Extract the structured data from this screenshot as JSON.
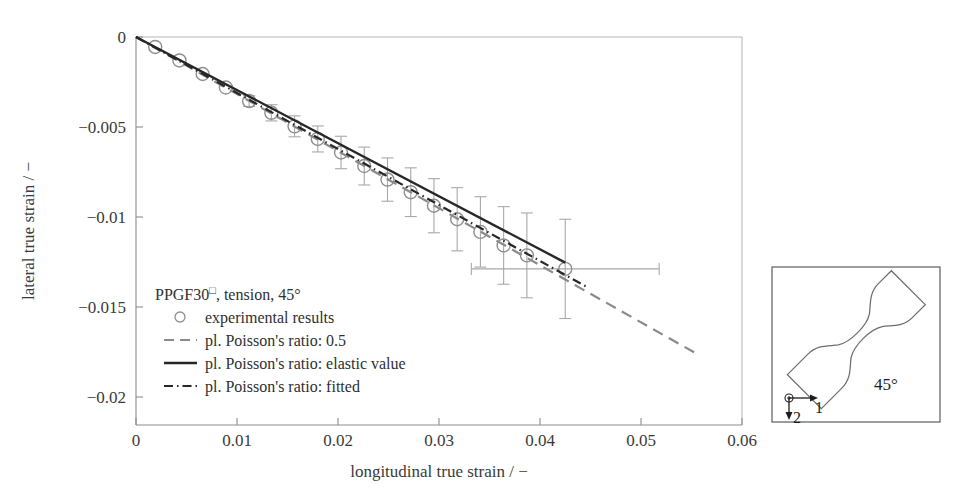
{
  "figure": {
    "background_color": "#ffffff",
    "axis_color": "#9a9a9a",
    "text_color": "#3a3a3a"
  },
  "chart_data": {
    "type": "scatter",
    "title": "",
    "xlabel": "longitudinal true strain / −",
    "ylabel": "lateral true strain / −",
    "xlim": [
      0,
      0.06
    ],
    "ylim": [
      -0.0215,
      0.0
    ],
    "xticks": [
      0,
      0.01,
      0.02,
      0.03,
      0.04,
      0.05,
      0.06
    ],
    "xtick_labels": [
      "0",
      "0.01",
      "0.02",
      "0.03",
      "0.04",
      "0.05",
      "0.06"
    ],
    "yticks": [
      0,
      -0.005,
      -0.01,
      -0.015,
      -0.02
    ],
    "ytick_labels": [
      "0",
      "−0.005",
      "−0.01",
      "−0.015",
      "−0.02"
    ],
    "grid": false,
    "legend_position": "lower-left-inside",
    "series": [
      {
        "name": "experimental results",
        "type": "scatter-with-errorbars",
        "marker": "open-circle",
        "color": "#8f8f8f",
        "errorbar_color": "#a8a8a8",
        "x": [
          0.0019,
          0.0043,
          0.0066,
          0.0089,
          0.0112,
          0.0134,
          0.0157,
          0.018,
          0.0203,
          0.0226,
          0.0249,
          0.0272,
          0.0295,
          0.0318,
          0.0341,
          0.0364,
          0.0387,
          0.0425
        ],
        "y": [
          -0.00055,
          -0.0013,
          -0.00205,
          -0.0028,
          -0.00355,
          -0.0042,
          -0.00495,
          -0.00565,
          -0.0064,
          -0.00715,
          -0.0079,
          -0.0086,
          -0.00935,
          -0.0101,
          -0.0108,
          -0.01155,
          -0.0121,
          -0.01285
        ],
        "yerr": [
          0.0,
          0.0,
          0.0,
          0.0,
          0.0003,
          0.00045,
          0.00058,
          0.00072,
          0.0009,
          0.00105,
          0.0012,
          0.00135,
          0.0015,
          0.00175,
          0.00195,
          0.00215,
          0.00235,
          0.00275
        ],
        "xerr_last": 0.0093
      },
      {
        "name": "pl. Poisson's ratio: 0.5",
        "type": "line",
        "style": "dashed",
        "color": "#8a8a8a",
        "x": [
          0.0,
          0.0555
        ],
        "y": [
          0.0,
          -0.01755
        ]
      },
      {
        "name": "pl. Poisson's ratio: elastic value",
        "type": "line",
        "style": "solid",
        "color": "#272727",
        "x": [
          0.0,
          0.0425
        ],
        "y": [
          0.0,
          -0.0125
        ]
      },
      {
        "name": "pl. Poisson's ratio: fitted",
        "type": "line",
        "style": "dash-dot",
        "color": "#272727",
        "x": [
          0.0,
          0.0448
        ],
        "y": [
          0.0,
          -0.0139
        ]
      }
    ]
  },
  "legend": {
    "title_main": "PPGF30",
    "title_sup": "□",
    "title_rest": ", tension, 45°",
    "entries": [
      {
        "marker": "open-circle",
        "label": "experimental results"
      },
      {
        "marker": "dashed-line",
        "label": "pl. Poisson's ratio: 0.5"
      },
      {
        "marker": "solid-line",
        "label": "pl. Poisson's ratio: elastic value"
      },
      {
        "marker": "dash-dot-line",
        "label": "pl. Poisson's ratio: fitted"
      }
    ]
  },
  "inset": {
    "angle_label": "45°",
    "axis_1_label": "1",
    "axis_2_label": "2",
    "description": "dogbone tensile specimen oriented at 45 degrees"
  }
}
